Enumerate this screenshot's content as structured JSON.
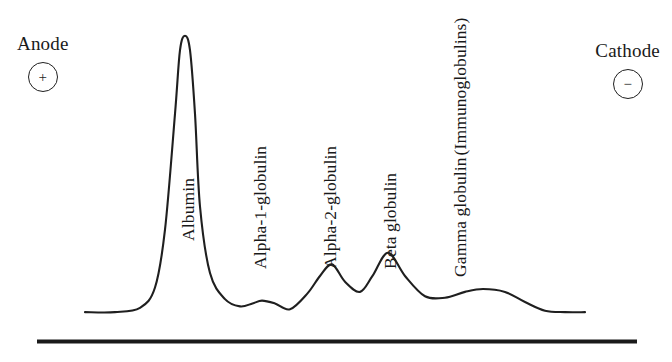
{
  "figure": {
    "background_color": "#ffffff",
    "ink_color": "#1a1a1a"
  },
  "electrodes": {
    "anode": {
      "label": "Anode",
      "sign": "+",
      "sign_icon": "plus-in-circle-icon"
    },
    "cathode": {
      "label": "Cathode",
      "sign": "−",
      "sign_icon": "minus-in-circle-icon"
    }
  },
  "peak_labels": [
    {
      "id": "albumin",
      "text": "Albumin"
    },
    {
      "id": "alpha-1",
      "text": "Alpha-1-globulin"
    },
    {
      "id": "alpha-2",
      "text": "Alpha-2-globulin"
    },
    {
      "id": "beta",
      "text": "Beta globulin"
    },
    {
      "id": "gamma-line-1",
      "text": "Gamma globulin"
    },
    {
      "id": "gamma-line-2",
      "text": "(Immunoglobulins)"
    }
  ],
  "chart_data": {
    "type": "line",
    "xlabel": "",
    "ylabel": "",
    "grid": false,
    "legend": "none",
    "axis_note": "Migration from anode (+, left) to cathode (−, right); vertical axis is relative protein concentration (densitometry, arbitrary units).",
    "xlim": [
      0,
      100
    ],
    "ylim": [
      0,
      100
    ],
    "categories": [
      "Albumin",
      "Alpha-1-globulin",
      "Alpha-2-globulin",
      "Beta globulin",
      "Gamma globulin (Immunoglobulins)"
    ],
    "peak_positions_x": [
      20,
      35.4,
      49.4,
      60.6,
      79.6
    ],
    "peak_heights": [
      97,
      5.5,
      18,
      22,
      9.5
    ],
    "series": [
      {
        "name": "Densitometric trace",
        "x": [
          0,
          6,
          11,
          14,
          16,
          18,
          19,
          20,
          21,
          22,
          23,
          25,
          28,
          31,
          33.5,
          35.4,
          38,
          41,
          44.5,
          47,
          49.4,
          52,
          55,
          57.5,
          60.6,
          64,
          68,
          72,
          76,
          79.6,
          84,
          88,
          92,
          96,
          100
        ],
        "y": [
          1.5,
          1.5,
          3,
          10,
          30,
          70,
          92,
          97,
          92,
          70,
          38,
          15,
          6,
          3.5,
          4.5,
          5.5,
          4.5,
          2.5,
          8,
          14,
          18,
          12,
          8.5,
          14,
          22,
          14,
          7,
          6.5,
          8.5,
          9.5,
          8.5,
          5,
          2,
          1.5,
          1.5
        ]
      }
    ],
    "baseline": {
      "drawn": true,
      "thickness_px": 4,
      "color": "#1a1a1a"
    }
  }
}
